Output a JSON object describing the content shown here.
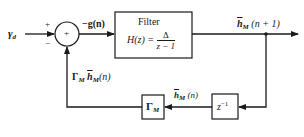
{
  "diagram": {
    "input": {
      "symbol": "γ",
      "subscript": "d"
    },
    "summing_junction": {
      "center_sign": "+",
      "top_input_sign": "+",
      "bottom_input_sign": "−"
    },
    "error_signal": {
      "label": "−g(n)"
    },
    "filter_block": {
      "title": "Filter",
      "transfer_lhs": "H(z) =",
      "numerator": "Δ",
      "denominator": "z − 1"
    },
    "output": {
      "symbol": "h",
      "subscript": "M",
      "arg": "(n + 1)"
    },
    "delay_block": {
      "base": "z",
      "exponent": "−1"
    },
    "delayed_signal": {
      "symbol": "h",
      "subscript": "M",
      "arg": "(n)"
    },
    "gain_block": {
      "symbol": "Γ",
      "subscript": "M"
    },
    "feedback_signal": {
      "gain": "Γ",
      "gain_sub": "M",
      "symbol": "h",
      "subscript": "M",
      "arg": "(n)"
    },
    "colors": {
      "line": "#1a1a1a",
      "background": "#ffffff"
    }
  }
}
